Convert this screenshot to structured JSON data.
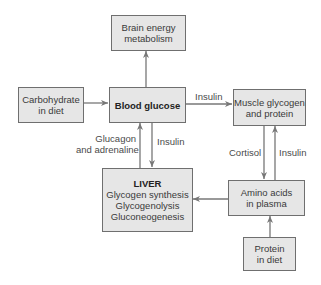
{
  "diagram": {
    "nodes": {
      "brain": {
        "line1": "Brain energy",
        "line2": "metabolism"
      },
      "carbohydrate": {
        "line1": "Carbohydrate",
        "line2": "in diet"
      },
      "blood_glucose": {
        "title": "Blood glucose"
      },
      "muscle": {
        "line1": "Muscle glycogen",
        "line2": "and protein"
      },
      "liver": {
        "title": "LIVER",
        "line1": "Glycogen synthesis",
        "line2": "Glycogenolysis",
        "line3": "Gluconeogenesis"
      },
      "amino_acids": {
        "line1": "Amino acids",
        "line2": "in plasma"
      },
      "protein": {
        "line1": "Protein",
        "line2": "in diet"
      }
    },
    "edge_labels": {
      "glucose_to_muscle": "Insulin",
      "liver_to_glucose_line1": "Glucagon",
      "liver_to_glucose_line2": "and adrenaline",
      "glucose_to_liver": "Insulin",
      "muscle_to_amino": "Cortisol",
      "amino_to_muscle": "Insulin"
    },
    "edges": [
      {
        "from": "Carbohydrate in diet",
        "to": "Blood glucose"
      },
      {
        "from": "Blood glucose",
        "to": "Brain energy metabolism"
      },
      {
        "from": "Blood glucose",
        "to": "Muscle glycogen and protein",
        "label": "Insulin"
      },
      {
        "from": "Blood glucose",
        "to": "LIVER",
        "label": "Insulin"
      },
      {
        "from": "LIVER",
        "to": "Blood glucose",
        "label": "Glucagon and adrenaline"
      },
      {
        "from": "Muscle glycogen and protein",
        "to": "Amino acids in plasma",
        "label": "Cortisol"
      },
      {
        "from": "Amino acids in plasma",
        "to": "Muscle glycogen and protein",
        "label": "Insulin"
      },
      {
        "from": "Amino acids in plasma",
        "to": "LIVER"
      },
      {
        "from": "Protein in diet",
        "to": "Amino acids in plasma"
      }
    ],
    "colors": {
      "box_fill": "#e6e6e6",
      "box_border": "#6f6f6f",
      "arrow": "#777777",
      "text": "#3a3a3a"
    }
  }
}
